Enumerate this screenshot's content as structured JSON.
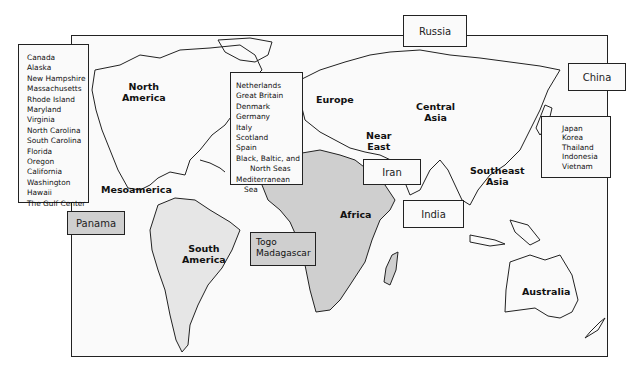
{
  "map": {
    "region_labels": {
      "north_america": "North\nAmerica",
      "north_america_l1": "North",
      "north_america_l2": "America",
      "mesoamerica": "Mesoamerica",
      "south_america_l1": "South",
      "south_america_l2": "America",
      "europe": "Europe",
      "central_asia_l1": "Central",
      "central_asia_l2": "Asia",
      "near_east_l1": "Near",
      "near_east_l2": "East",
      "africa": "Africa",
      "southeast_asia_l1": "Southeast",
      "southeast_asia_l2": "Asia",
      "australia": "Australia"
    },
    "americas_box": {
      "items": [
        "Canada",
        "Alaska",
        "New Hampshire",
        "Massachusetts",
        "Rhode Island",
        "Maryland",
        "Virginia",
        "North Carolina",
        "South Carolina",
        "Florida",
        "Oregon",
        "California",
        "Washington",
        "Hawaii",
        "The Gulf Center"
      ]
    },
    "europe_box": {
      "items": [
        "Netherlands",
        "Great Britain",
        "Denmark",
        "Germany",
        "Italy",
        "Scotland",
        "Spain",
        "Black, Baltic, and",
        "North Seas",
        "Mediterranean",
        "Sea"
      ]
    },
    "asia_box": {
      "items": [
        "Japan",
        "Korea",
        "Thailand",
        "Indonesia",
        "Vietnam"
      ]
    },
    "single_boxes": {
      "russia": "Russia",
      "china": "China",
      "iran": "Iran",
      "india": "India",
      "panama": "Panama"
    },
    "africa_box": {
      "items": [
        "Togo",
        "Madagascar"
      ]
    },
    "colors": {
      "land_shaded": "#cfcfcf",
      "land_light": "#e6e6e6",
      "ocean": "#fafafa",
      "outline": "#222222"
    }
  }
}
